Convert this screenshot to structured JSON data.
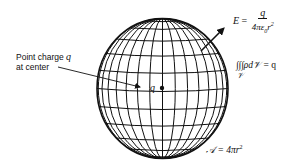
{
  "figure": {
    "sphere": {
      "cx": 162.5,
      "cy": 88.5,
      "rx": 65.5,
      "ry": 70,
      "meridians": 16,
      "parallels": 11,
      "stroke": "#111111"
    },
    "point_charge_label": {
      "line1": "Point charge",
      "q": "q",
      "line2": "at center"
    },
    "center_charge": {
      "symbol": "q"
    },
    "field_equation": {
      "lhs": "E",
      "eq": "=",
      "numerator": "q",
      "denominator": "4πε",
      "den_sub": "0",
      "den_r": "r",
      "den_exp": "2"
    },
    "volume_integral": {
      "integral": "∫∫∫ρd",
      "vol_symbol": "𝒱",
      "eq": "= q",
      "subscript": "𝒱"
    },
    "area_equation": {
      "symbol": "𝒜",
      "eq": "= 4πr",
      "exp": "2"
    }
  }
}
